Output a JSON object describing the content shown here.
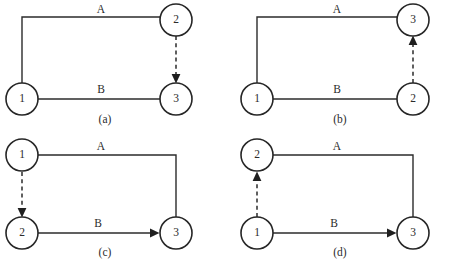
{
  "figure": {
    "background_color": "#ffffff",
    "ink_color": "#2b2b2b",
    "panel_count": 4
  },
  "panels": [
    {
      "id": "a",
      "caption": "(a)",
      "nodes": [
        {
          "id": "n1",
          "label": "1",
          "position": "left-bottom"
        },
        {
          "id": "n2",
          "label": "2",
          "position": "right-top"
        },
        {
          "id": "n3",
          "label": "3",
          "position": "right-bottom"
        }
      ],
      "edges": [
        {
          "id": "edge-a",
          "label": "A",
          "style": "solid",
          "from": "1",
          "to": "2",
          "route": "up-then-right",
          "arrow": "right"
        },
        {
          "id": "edge-b",
          "label": "B",
          "style": "solid",
          "from": "1",
          "to": "3",
          "route": "straight-right",
          "arrow": "right"
        },
        {
          "id": "edge-dep",
          "label": "",
          "style": "dashed",
          "from": "2",
          "to": "3",
          "route": "vertical",
          "arrow": "down"
        }
      ]
    },
    {
      "id": "b",
      "caption": "(b)",
      "nodes": [
        {
          "id": "n1",
          "label": "1",
          "position": "left-bottom"
        },
        {
          "id": "n3",
          "label": "3",
          "position": "right-top"
        },
        {
          "id": "n2",
          "label": "2",
          "position": "right-bottom"
        }
      ],
      "edges": [
        {
          "id": "edge-a",
          "label": "A",
          "style": "solid",
          "from": "1",
          "to": "3",
          "route": "up-then-right",
          "arrow": "right"
        },
        {
          "id": "edge-b",
          "label": "B",
          "style": "solid",
          "from": "1",
          "to": "2",
          "route": "straight-right",
          "arrow": "right"
        },
        {
          "id": "edge-dep",
          "label": "",
          "style": "dashed",
          "from": "2",
          "to": "3",
          "route": "vertical",
          "arrow": "up"
        }
      ]
    },
    {
      "id": "c",
      "caption": "(c)",
      "nodes": [
        {
          "id": "n1",
          "label": "1",
          "position": "left-top"
        },
        {
          "id": "n2",
          "label": "2",
          "position": "left-bottom"
        },
        {
          "id": "n3",
          "label": "3",
          "position": "right-bottom"
        }
      ],
      "edges": [
        {
          "id": "edge-a",
          "label": "A",
          "style": "solid",
          "from": "1",
          "to": "3",
          "route": "right-then-down",
          "arrow": "down"
        },
        {
          "id": "edge-b",
          "label": "B",
          "style": "solid",
          "from": "2",
          "to": "3",
          "route": "straight-right",
          "arrow": "right"
        },
        {
          "id": "edge-dep",
          "label": "",
          "style": "dashed",
          "from": "1",
          "to": "2",
          "route": "vertical",
          "arrow": "down"
        }
      ]
    },
    {
      "id": "d",
      "caption": "(d)",
      "nodes": [
        {
          "id": "n2",
          "label": "2",
          "position": "left-top"
        },
        {
          "id": "n1",
          "label": "1",
          "position": "left-bottom"
        },
        {
          "id": "n3",
          "label": "3",
          "position": "right-bottom"
        }
      ],
      "edges": [
        {
          "id": "edge-a",
          "label": "A",
          "style": "solid",
          "from": "2",
          "to": "3",
          "route": "right-then-down",
          "arrow": "down"
        },
        {
          "id": "edge-b",
          "label": "B",
          "style": "solid",
          "from": "1",
          "to": "3",
          "route": "straight-right",
          "arrow": "right"
        },
        {
          "id": "edge-dep",
          "label": "",
          "style": "dashed",
          "from": "1",
          "to": "2",
          "route": "vertical",
          "arrow": "up"
        }
      ]
    }
  ]
}
